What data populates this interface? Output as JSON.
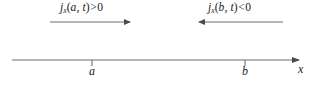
{
  "figure": {
    "background_color": "#ffffff",
    "line_color": "#6e6e6e",
    "text_color": "#1a1a1a"
  },
  "flux_arrows": [
    {
      "name": "left-flux",
      "symbol": "j",
      "subscript": "x",
      "open_paren": "(",
      "argument": "a, t",
      "close_paren": ")",
      "relation": ">",
      "value": "0",
      "full_text": "jx(a, t) > 0",
      "direction": "right",
      "x_start": 50,
      "x_end": 133,
      "y": 22
    },
    {
      "name": "right-flux",
      "symbol": "j",
      "subscript": "x",
      "open_paren": "(",
      "argument": "b, t",
      "close_paren": ")",
      "relation": "<",
      "value": "0",
      "full_text": "jx(b, t) < 0",
      "direction": "left",
      "x_start": 283,
      "x_end": 196,
      "y": 22
    }
  ],
  "axis": {
    "name": "x-axis",
    "label": "x",
    "x_start": 12,
    "x_end": 303,
    "y": 60,
    "arrow_direction": "right",
    "ticks": [
      {
        "label": "a",
        "x": 92
      },
      {
        "label": "b",
        "x": 245
      }
    ]
  }
}
